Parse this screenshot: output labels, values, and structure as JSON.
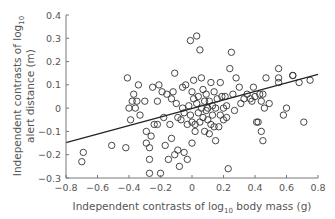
{
  "chart_data": {
    "type": "scatter",
    "title": "",
    "xlabel": "Independent contrasts of log10 body mass (g)",
    "xlabel_parts": {
      "pre": "Independent contrasts of log",
      "sub": "10",
      "post": " body mass (g)"
    },
    "ylabel": "Independent contrasts of log10 alert distance (m)",
    "ylabel_parts": {
      "line1_pre": "Independent contrasts of log",
      "line1_sub": "10",
      "line2": "alert distance (m)"
    },
    "xlim": [
      -0.8,
      0.8
    ],
    "ylim": [
      -0.3,
      0.4
    ],
    "x_ticks": [
      "−0.8",
      "−0.6",
      "−0.4",
      "−0.2",
      "0",
      "0.2",
      "0.4",
      "0.6",
      "0.8"
    ],
    "x_tick_values": [
      -0.8,
      -0.6,
      -0.4,
      -0.2,
      0,
      0.2,
      0.4,
      0.6,
      0.8
    ],
    "y_ticks": [
      "0.4",
      "0.3",
      "0.2",
      "0.1",
      "0",
      "−0.1",
      "−0.2",
      "−0.3"
    ],
    "y_tick_values": [
      0.4,
      0.3,
      0.2,
      0.1,
      0,
      -0.1,
      -0.2,
      -0.3
    ],
    "grid": false,
    "marker": "open-circle",
    "regression_line": {
      "x": [
        -0.8,
        0.8
      ],
      "y": [
        -0.148,
        0.145
      ]
    },
    "points": [
      [
        -0.69,
        -0.19
      ],
      [
        -0.7,
        -0.23
      ],
      [
        -0.51,
        -0.16
      ],
      [
        -0.42,
        -0.17
      ],
      [
        -0.41,
        0.13
      ],
      [
        -0.37,
        0.06
      ],
      [
        -0.36,
        -0.0
      ],
      [
        -0.4,
        0.0
      ],
      [
        -0.38,
        0.03
      ],
      [
        -0.39,
        -0.05
      ],
      [
        -0.34,
        0.1
      ],
      [
        -0.35,
        0.03
      ],
      [
        -0.33,
        -0.03
      ],
      [
        -0.3,
        0.03
      ],
      [
        -0.29,
        -0.1
      ],
      [
        -0.29,
        -0.15
      ],
      [
        -0.27,
        -0.17
      ],
      [
        -0.27,
        -0.22
      ],
      [
        -0.27,
        -0.28
      ],
      [
        -0.26,
        -0.12
      ],
      [
        -0.25,
        0.09
      ],
      [
        -0.24,
        -0.07
      ],
      [
        -0.22,
        -0.07
      ],
      [
        -0.22,
        0.03
      ],
      [
        -0.21,
        0.1
      ],
      [
        -0.2,
        -0.28
      ],
      [
        -0.19,
        0.07
      ],
      [
        -0.18,
        -0.04
      ],
      [
        -0.17,
        -0.16
      ],
      [
        -0.16,
        0.06
      ],
      [
        -0.15,
        -0.22
      ],
      [
        -0.14,
        -0.07
      ],
      [
        -0.13,
        0.04
      ],
      [
        -0.13,
        -0.13
      ],
      [
        -0.12,
        0.07
      ],
      [
        -0.11,
        0.15
      ],
      [
        -0.11,
        -0.2
      ],
      [
        -0.1,
        0.02
      ],
      [
        -0.09,
        -0.04
      ],
      [
        -0.09,
        -0.18
      ],
      [
        -0.08,
        -0.25
      ],
      [
        -0.07,
        -0.05
      ],
      [
        -0.06,
        0.09
      ],
      [
        -0.06,
        0.0
      ],
      [
        -0.05,
        -0.02
      ],
      [
        -0.05,
        -0.19
      ],
      [
        -0.04,
        0.1
      ],
      [
        -0.03,
        -0.07
      ],
      [
        -0.03,
        -0.22
      ],
      [
        -0.02,
        0.01
      ],
      [
        -0.01,
        0.29
      ],
      [
        -0.01,
        -0.03
      ],
      [
        0.0,
        0.07
      ],
      [
        0.0,
        -0.06
      ],
      [
        0.0,
        -0.15
      ],
      [
        0.01,
        0.12
      ],
      [
        0.01,
        0.04
      ],
      [
        0.02,
        -0.07
      ],
      [
        0.02,
        -0.1
      ],
      [
        0.03,
        0.31
      ],
      [
        0.03,
        0.02
      ],
      [
        0.04,
        0.05
      ],
      [
        0.04,
        -0.02
      ],
      [
        0.05,
        0.25
      ],
      [
        0.05,
        -0.06
      ],
      [
        0.06,
        0.13
      ],
      [
        0.06,
        0.0
      ],
      [
        0.07,
        0.08
      ],
      [
        0.07,
        -0.04
      ],
      [
        0.08,
        0.03
      ],
      [
        0.08,
        -0.1
      ],
      [
        0.09,
        0.06
      ],
      [
        0.09,
        -0.01
      ],
      [
        0.1,
        0.0
      ],
      [
        0.1,
        -0.05
      ],
      [
        0.11,
        0.03
      ],
      [
        0.11,
        -0.11
      ],
      [
        0.12,
        0.11
      ],
      [
        0.12,
        -0.07
      ],
      [
        0.13,
        0.01
      ],
      [
        0.13,
        -0.03
      ],
      [
        0.14,
        0.07
      ],
      [
        0.14,
        -0.08
      ],
      [
        0.15,
        0.0
      ],
      [
        0.15,
        -0.14
      ],
      [
        0.16,
        0.04
      ],
      [
        0.17,
        -0.08
      ],
      [
        0.18,
        0.11
      ],
      [
        0.18,
        -0.03
      ],
      [
        0.19,
        0.05
      ],
      [
        0.2,
        0.0
      ],
      [
        0.2,
        -0.05
      ],
      [
        0.21,
        0.05
      ],
      [
        0.22,
        -0.04
      ],
      [
        0.22,
        0.01
      ],
      [
        0.23,
        -0.26
      ],
      [
        0.24,
        0.17
      ],
      [
        0.25,
        0.24
      ],
      [
        0.26,
        0.06
      ],
      [
        0.27,
        -0.01
      ],
      [
        0.28,
        0.13
      ],
      [
        0.3,
        0.09
      ],
      [
        0.31,
        0.02
      ],
      [
        0.33,
        0.04
      ],
      [
        0.35,
        0.06
      ],
      [
        0.37,
        0.04
      ],
      [
        0.38,
        0.03
      ],
      [
        0.39,
        0.09
      ],
      [
        0.4,
        0.05
      ],
      [
        0.41,
        -0.06
      ],
      [
        0.42,
        -0.06
      ],
      [
        0.43,
        0.06
      ],
      [
        0.44,
        0.03
      ],
      [
        0.44,
        -0.1
      ],
      [
        0.45,
        0.06
      ],
      [
        0.45,
        -0.14
      ],
      [
        0.46,
        0.0
      ],
      [
        0.47,
        0.13
      ],
      [
        0.49,
        0.02
      ],
      [
        0.55,
        0.17
      ],
      [
        0.55,
        0.11
      ],
      [
        0.55,
        0.13
      ],
      [
        0.58,
        -0.03
      ],
      [
        0.6,
        0.0
      ],
      [
        0.64,
        0.14
      ],
      [
        0.64,
        0.14
      ],
      [
        0.68,
        0.11
      ],
      [
        0.71,
        -0.06
      ],
      [
        0.75,
        0.12
      ]
    ]
  }
}
